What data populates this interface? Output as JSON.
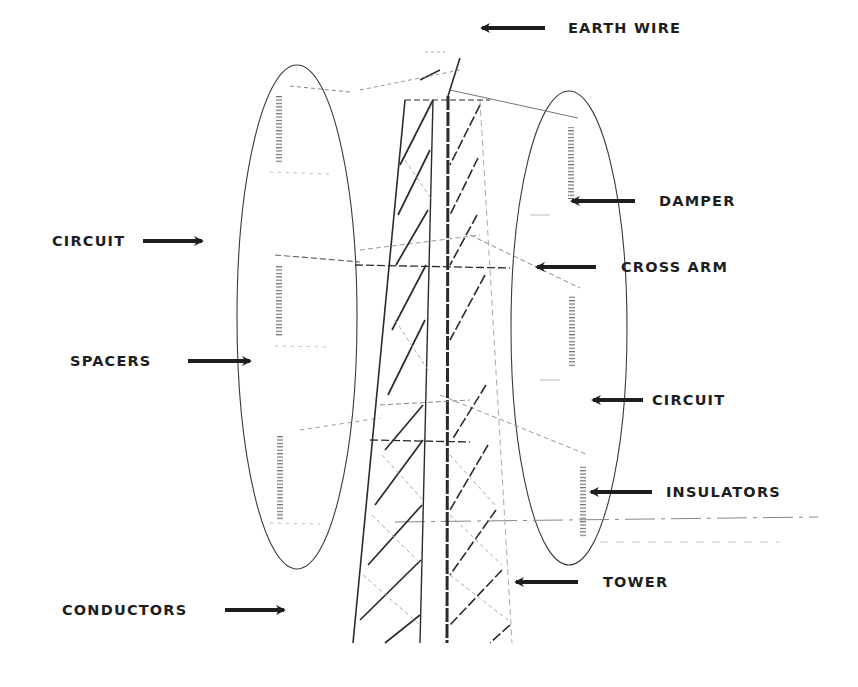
{
  "diagram": {
    "colors": {
      "ink": "#1e1e1e",
      "faint": "#9a9a9a",
      "background": "#ffffff"
    },
    "labels": {
      "earth_wire": "EARTH WIRE",
      "damper": "DAMPER",
      "cross_arm": "CROSS ARM",
      "circuit_left": "CIRCUIT",
      "spacers": "SPACERS",
      "circuit_right": "CIRCUIT",
      "insulators": "INSULATORS",
      "tower": "TOWER",
      "conductors": "CONDUCTORS"
    },
    "arrows": [
      {
        "name": "earth-wire-arrow",
        "direction": "left",
        "x1": 545,
        "y1": 28,
        "x2": 475,
        "y2": 28
      },
      {
        "name": "damper-arrow",
        "direction": "left",
        "x1": 635,
        "y1": 201,
        "x2": 566,
        "y2": 201
      },
      {
        "name": "cross-arm-arrow",
        "direction": "left",
        "x1": 596,
        "y1": 267,
        "x2": 531,
        "y2": 267
      },
      {
        "name": "circuit-left-arrow",
        "direction": "right",
        "x1": 143,
        "y1": 241,
        "x2": 208,
        "y2": 241
      },
      {
        "name": "spacers-arrow",
        "direction": "right",
        "x1": 188,
        "y1": 361,
        "x2": 256,
        "y2": 361
      },
      {
        "name": "circuit-right-arrow",
        "direction": "left",
        "x1": 643,
        "y1": 400,
        "x2": 587,
        "y2": 400
      },
      {
        "name": "insulators-arrow",
        "direction": "left",
        "x1": 652,
        "y1": 492,
        "x2": 585,
        "y2": 492
      },
      {
        "name": "tower-arrow",
        "direction": "left",
        "x1": 578,
        "y1": 582,
        "x2": 510,
        "y2": 582
      },
      {
        "name": "conductors-arrow",
        "direction": "right",
        "x1": 225,
        "y1": 610,
        "x2": 290,
        "y2": 610
      }
    ]
  }
}
